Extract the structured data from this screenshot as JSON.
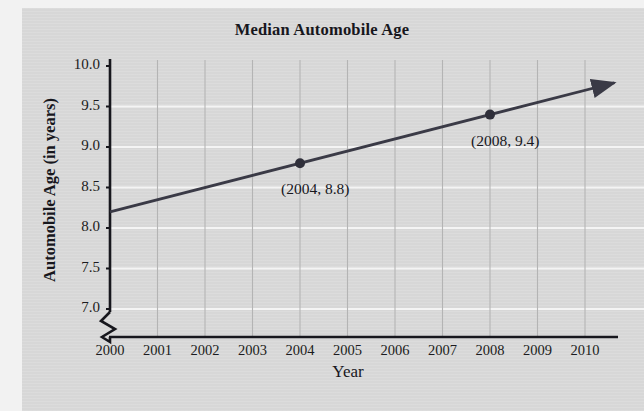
{
  "chart_data": {
    "type": "line",
    "title": "Median Automobile Age",
    "xlabel": "Year",
    "ylabel": "Automobile Age (in years)",
    "x": [
      2000,
      2001,
      2002,
      2003,
      2004,
      2005,
      2006,
      2007,
      2008,
      2009,
      2010
    ],
    "xtick_labels": [
      "2000",
      "2001",
      "2002",
      "2003",
      "2004",
      "2005",
      "2006",
      "2007",
      "2008",
      "2009",
      "2010"
    ],
    "ytick_labels": [
      "10.0",
      "9.5",
      "9.0",
      "8.5",
      "8.0",
      "7.5",
      "7.0"
    ],
    "yticks": [
      10.0,
      9.5,
      9.0,
      8.5,
      8.0,
      7.5,
      7.0
    ],
    "xlim": [
      2000,
      2010
    ],
    "ylim": [
      7.0,
      10.0
    ],
    "y_axis_break": true,
    "grid": "both",
    "legend": "none",
    "series": [
      {
        "name": "Median automobile age",
        "values": [
          8.2,
          8.35,
          8.5,
          8.65,
          8.8,
          8.95,
          9.1,
          9.25,
          9.4,
          9.55,
          9.7
        ],
        "line_color": "#3a3a46",
        "arrow_end": true
      }
    ],
    "markers": [
      {
        "x": 2004,
        "y": 8.8,
        "label": "(2004, 8.8)"
      },
      {
        "x": 2008,
        "y": 9.4,
        "label": "(2008, 9.4)"
      }
    ],
    "annotations": [
      {
        "text": "(2004, 8.8)",
        "x": 2004,
        "y": 8.8
      },
      {
        "text": "(2008, 9.4)",
        "x": 2008,
        "y": 9.4
      }
    ],
    "colors": {
      "background": "#d7d7d7",
      "axis": "#17171d",
      "h_gridline": "#f4f4f4",
      "v_gridline": "#b4b4b4",
      "line": "#3a3a46",
      "marker": "#2f2f3a",
      "text": "#17171d"
    }
  },
  "ticks": {
    "y": [
      "10.0",
      "9.5",
      "9.0",
      "8.5",
      "8.0",
      "7.5",
      "7.0"
    ],
    "x": [
      "2000",
      "2001",
      "2002",
      "2003",
      "2004",
      "2005",
      "2006",
      "2007",
      "2008",
      "2009",
      "2010"
    ]
  },
  "labels": {
    "title": "Median Automobile Age",
    "y_axis": "Automobile Age (in years)",
    "x_axis": "Year",
    "point_1": "(2004, 8.8)",
    "point_2": "(2008, 9.4)"
  }
}
